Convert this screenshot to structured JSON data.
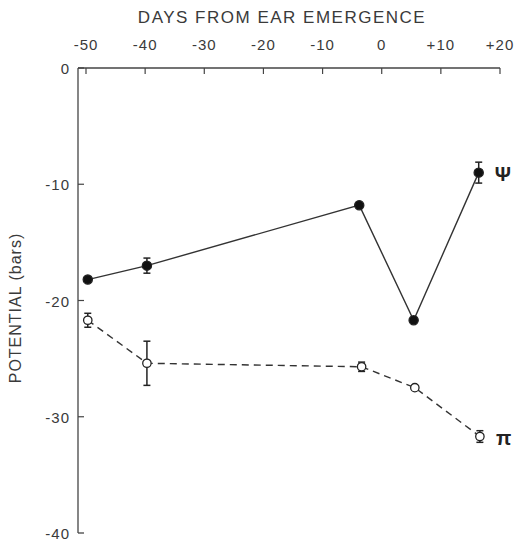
{
  "chart_data": {
    "type": "line",
    "title": "DAYS FROM EAR EMERGENCE",
    "xlabel": "DAYS FROM EAR EMERGENCE",
    "ylabel": "POTENTIAL (bars)",
    "x_axis_position": "top",
    "xlim": [
      -50,
      20
    ],
    "ylim": [
      -40,
      0
    ],
    "xticks": [
      "-50",
      "-40",
      "-30",
      "-20",
      "-10",
      "0",
      "+10",
      "+20"
    ],
    "xtick_values": [
      -50,
      -40,
      -30,
      -20,
      -10,
      0,
      10,
      20
    ],
    "yticks": [
      "0",
      "-10",
      "-20",
      "-30",
      "-40"
    ],
    "ytick_values": [
      0,
      -10,
      -20,
      -30,
      -40
    ],
    "grid": false,
    "legend": "inline labels at line ends",
    "series": [
      {
        "name": "Ψ",
        "marker": "filled-circle",
        "line": "solid",
        "x": [
          -49.7,
          -39.7,
          -3.8,
          5.4,
          16.4
        ],
        "values": [
          -18.2,
          -17.0,
          -11.8,
          -21.7,
          -9.0
        ],
        "error": [
          0,
          0.65,
          0,
          0,
          0.9
        ]
      },
      {
        "name": "π",
        "marker": "open-circle",
        "line": "dashed",
        "x": [
          -49.7,
          -39.7,
          -3.4,
          5.6,
          16.6
        ],
        "values": [
          -21.7,
          -25.4,
          -25.7,
          -27.5,
          -31.7
        ],
        "error": [
          0.6,
          1.9,
          0.4,
          0,
          0.5
        ]
      }
    ]
  }
}
